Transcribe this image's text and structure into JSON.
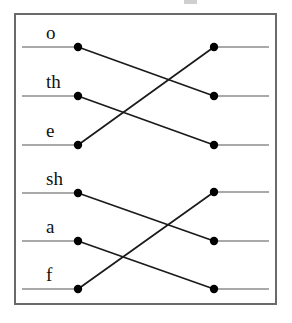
{
  "canvas": {
    "width": 292,
    "height": 323,
    "background": "#ffffff"
  },
  "frame": {
    "name": "diagram-border",
    "x": 14,
    "y": 13,
    "width": 263,
    "height": 292,
    "stroke": "#6a6a6a",
    "stroke_width": 2,
    "fill": "#ffffff"
  },
  "style": {
    "stub_color": "#8d8d8d",
    "stub_width": 1.6,
    "connector_color": "#1a1a1a",
    "connector_width": 1.7,
    "node_color": "#000000",
    "node_radius": 4.2,
    "label_color": "#111111",
    "label_font_size": 19
  },
  "geometry": {
    "left_node_x": 78,
    "right_node_x": 214,
    "left_stub_start_x": 22,
    "right_stub_end_x": 269,
    "label_offset_x": -32,
    "label_offset_y": -8
  },
  "chart_data": {
    "type": "diagram",
    "subtype": "bipartite-alignment-crossing",
    "title": "",
    "groups": [
      {
        "id": "group-upper",
        "rows": [
          {
            "id": "row-o",
            "label": "o",
            "y": 47,
            "left_index": 0,
            "right_index": 1
          },
          {
            "id": "row-th",
            "label": "th",
            "y": 96,
            "left_index": 1,
            "right_index": 2
          },
          {
            "id": "row-e",
            "label": "e",
            "y": 145,
            "left_index": 2,
            "right_index": 0
          }
        ],
        "right_y": [
          47,
          96,
          145
        ],
        "edges": [
          {
            "from": 0,
            "to": 1
          },
          {
            "from": 1,
            "to": 2
          },
          {
            "from": 2,
            "to": 0
          }
        ]
      },
      {
        "id": "group-lower",
        "rows": [
          {
            "id": "row-sh",
            "label": "sh",
            "y": 193,
            "left_index": 0,
            "right_index": 1
          },
          {
            "id": "row-a",
            "label": "a",
            "y": 241,
            "left_index": 1,
            "right_index": 2
          },
          {
            "id": "row-f",
            "label": "f",
            "y": 289,
            "left_index": 2,
            "right_index": 0
          }
        ],
        "right_y": [
          192,
          241,
          289
        ],
        "edges": [
          {
            "from": 0,
            "to": 1
          },
          {
            "from": 1,
            "to": 2
          },
          {
            "from": 2,
            "to": 0
          }
        ]
      }
    ],
    "left_labels": [
      "o",
      "th",
      "e",
      "sh",
      "a",
      "f"
    ]
  },
  "artifacts": [
    {
      "name": "top-edge-crop-mark",
      "x": 184,
      "y": 0,
      "width": 13,
      "height": 4,
      "color": "#cfcfcf"
    }
  ]
}
